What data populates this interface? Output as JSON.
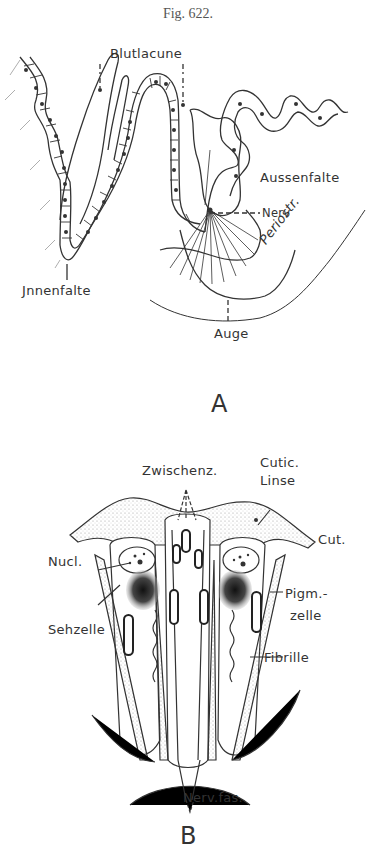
{
  "figure": {
    "title": "Fig. 622.",
    "panels": [
      {
        "letter": "A",
        "labels": {
          "blutlacune": "Blutlacune",
          "aussenfalte": "Aussenfalte",
          "nerv": "Nerv",
          "periostr": "Periostr.",
          "innenfalte": "Jnnenfalte",
          "auge": "Auge"
        }
      },
      {
        "letter": "B",
        "labels": {
          "zwischenz": "Zwischenz.",
          "cutic": "Cutic.",
          "linse": "Linse",
          "cut": "Cut.",
          "nucl": "Nucl.",
          "pigm": "Pigm.-",
          "zelle": "zelle",
          "sehzelle": "Sehzelle",
          "fibrille": "Fibrille",
          "nervfas": "Nerv.fas."
        }
      }
    ]
  }
}
